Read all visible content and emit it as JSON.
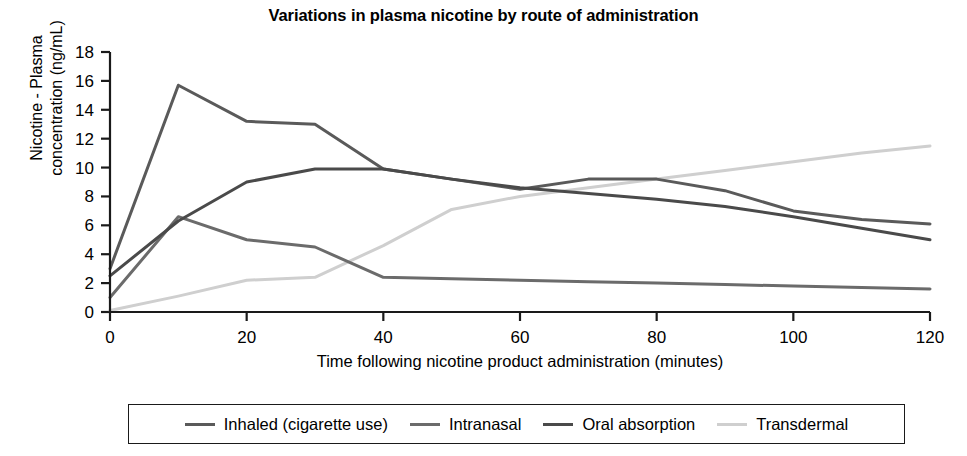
{
  "chart_data": {
    "type": "line",
    "title": "Variations in plasma nicotine by route of administration",
    "xlabel": "Time following nicotine product administration (minutes)",
    "ylabel": "Nicotine - Plasma concentration (ng/mL)",
    "ylabel_line1": "Nicotine - Plasma",
    "ylabel_line2": "concentration (ng/mL)",
    "x": [
      0,
      10,
      20,
      30,
      40,
      50,
      60,
      70,
      80,
      90,
      100,
      110,
      120
    ],
    "xlim": [
      0,
      120
    ],
    "ylim": [
      0,
      18
    ],
    "xticks": [
      0,
      20,
      40,
      60,
      80,
      100,
      120
    ],
    "yticks": [
      0,
      2,
      4,
      6,
      8,
      10,
      12,
      14,
      16,
      18
    ],
    "xtick_labels": [
      "0",
      "20",
      "40",
      "60",
      "80",
      "100",
      "120"
    ],
    "ytick_labels": [
      "0",
      "2",
      "4",
      "6",
      "8",
      "10",
      "12",
      "14",
      "16",
      "18"
    ],
    "grid": false,
    "legend_position": "below",
    "series": [
      {
        "name": "Inhaled (cigarette use)",
        "color": "#5a5a5a",
        "values": [
          3.0,
          15.7,
          13.2,
          13.0,
          9.9,
          9.2,
          8.5,
          9.2,
          9.2,
          8.4,
          7.0,
          6.4,
          6.1
        ]
      },
      {
        "name": "Intranasal",
        "color": "#6b6b6b",
        "values": [
          1.0,
          6.6,
          5.0,
          4.5,
          2.4,
          2.3,
          2.2,
          2.1,
          2.0,
          1.9,
          1.8,
          1.7,
          1.6
        ]
      },
      {
        "name": "Oral absorption",
        "color": "#4a4a4a",
        "values": [
          2.5,
          6.3,
          9.0,
          9.9,
          9.9,
          9.2,
          8.6,
          8.2,
          7.8,
          7.3,
          6.6,
          5.8,
          5.0
        ]
      },
      {
        "name": "Transdermal",
        "color": "#cfcfcf",
        "values": [
          0.1,
          1.1,
          2.2,
          2.4,
          4.6,
          7.1,
          8.0,
          8.6,
          9.2,
          9.8,
          10.4,
          11.0,
          11.5
        ]
      }
    ]
  },
  "legend": {
    "items": [
      {
        "label": "Inhaled (cigarette use)",
        "color": "#5a5a5a",
        "width": "3px"
      },
      {
        "label": "Intranasal",
        "color": "#6b6b6b",
        "width": "3px"
      },
      {
        "label": "Oral absorption",
        "color": "#4a4a4a",
        "width": "3px"
      },
      {
        "label": "Transdermal",
        "color": "#cfcfcf",
        "width": "3px"
      }
    ]
  },
  "axes": {
    "axis_color": "#1a1a1a"
  }
}
